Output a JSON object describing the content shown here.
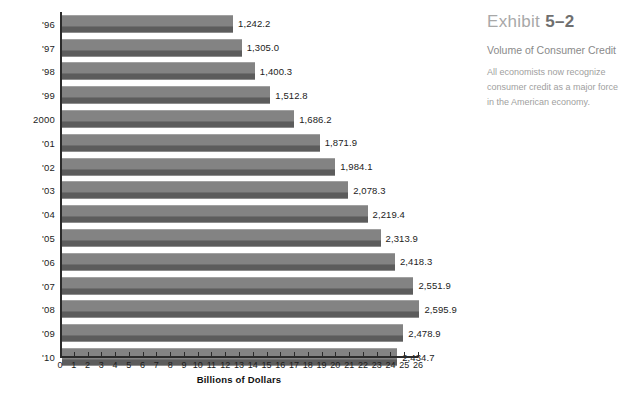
{
  "chart_data": {
    "type": "bar",
    "orientation": "horizontal",
    "title": "Volume of Consumer Credit",
    "xlabel": "Billions of Dollars",
    "ylabel": "",
    "xlim": [
      0,
      26
    ],
    "xticks": [
      0,
      1,
      2,
      3,
      4,
      5,
      6,
      7,
      8,
      9,
      10,
      11,
      12,
      13,
      14,
      15,
      16,
      17,
      18,
      19,
      20,
      21,
      22,
      23,
      24,
      25,
      26
    ],
    "grid": false,
    "legend": "none",
    "value_scale_note": "bar lengths plotted in hundreds of billions against a 0-26 axis",
    "categories": [
      "'96",
      "'97",
      "'98",
      "'99",
      "2000",
      "'01",
      "'02",
      "'03",
      "'04",
      "'05",
      "'06",
      "'07",
      "'08",
      "'09",
      "'10"
    ],
    "values": [
      1242.2,
      1305.0,
      1400.3,
      1512.8,
      1686.2,
      1871.9,
      1984.1,
      2078.3,
      2219.4,
      2313.9,
      2418.3,
      2551.9,
      2595.9,
      2478.9,
      2434.7
    ],
    "value_labels": [
      "1,242.2",
      "1,305.0",
      "1,400.3",
      "1,512.8",
      "1,686.2",
      "1,871.9",
      "1,984.1",
      "2,078.3",
      "2,219.4",
      "2,313.9",
      "2,418.3",
      "2,551.9",
      "2,595.9",
      "2,478.9",
      "2,434.7"
    ],
    "bar_color_top": "#838383",
    "bar_color_bottom": "#5c5c5c",
    "axis_color": "#2b2b2b"
  },
  "caption": {
    "exhibit_word": "Exhibit",
    "exhibit_number": "5–2",
    "subtitle": "Volume of Consumer Credit",
    "body": "All economists now recognize consumer credit as a major force in the American economy."
  },
  "colors": {
    "background": "#ffffff",
    "text": "#1c1c1c",
    "caption_heading": "#a8a8a8",
    "caption_number": "#6f6f6f",
    "caption_subtitle": "#8a8a8a",
    "caption_body": "#a0a0a0"
  }
}
